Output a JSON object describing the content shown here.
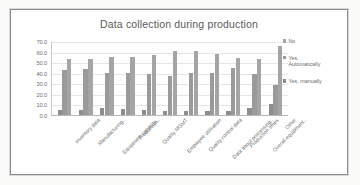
{
  "chart_data": {
    "type": "bar",
    "title": "Data collection during production",
    "xlabel": "",
    "ylabel": "",
    "ylim": [
      0,
      70
    ],
    "ytick_step": 10,
    "ytick_labels": [
      "70.0",
      "60.0",
      "50.0",
      "40.0",
      "30.0",
      "20.0",
      "10.0",
      "0.0"
    ],
    "grid": true,
    "legend_position": "right",
    "categories": [
      "Inventory data",
      "Manufacturing..",
      "Equipment capacity..",
      "Production..",
      "Quality MGMT",
      "Employee utilisation",
      "Quality control data",
      "Data about processing..",
      "Production times",
      "Overall equipment..",
      "Other"
    ],
    "series": [
      {
        "name": "Yes, manually",
        "color": "#8d8d8d",
        "values": [
          4.5,
          5.0,
          6.5,
          6.0,
          4.5,
          4.0,
          3.5,
          3.5,
          3.5,
          6.5,
          10.0
        ]
      },
      {
        "name": "Yes, Automatically",
        "color": "#9a9a9a",
        "values": [
          43.0,
          44.0,
          39.5,
          39.5,
          39.0,
          36.5,
          40.0,
          40.0,
          44.5,
          39.0,
          28.0
        ]
      },
      {
        "name": "No",
        "color": "#a5a5a5",
        "values": [
          53.0,
          53.0,
          54.5,
          55.0,
          56.5,
          61.0,
          60.5,
          57.5,
          53.5,
          53.0,
          65.0
        ]
      }
    ]
  },
  "legend": {
    "items": [
      {
        "label": "No",
        "series_index": 2
      },
      {
        "label": "Yes,\nAutomatically",
        "series_index": 1
      },
      {
        "label": "Yes, manually",
        "series_index": 0
      }
    ]
  }
}
